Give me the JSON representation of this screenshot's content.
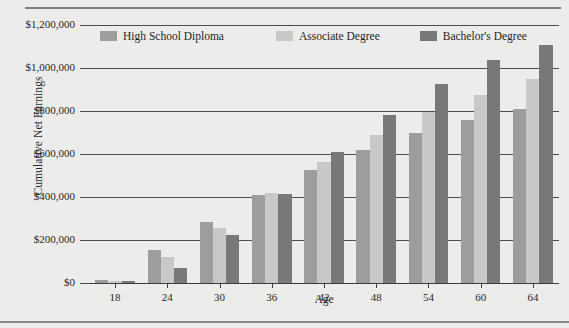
{
  "chart_data": {
    "type": "bar",
    "title": "",
    "xlabel": "Age",
    "ylabel": "Cumulative Net Earnings",
    "categories": [
      "18",
      "24",
      "30",
      "36",
      "42",
      "48",
      "54",
      "60",
      "64"
    ],
    "ylim": [
      0,
      1200000
    ],
    "ytick_values": [
      0,
      200000,
      400000,
      600000,
      800000,
      1000000,
      1200000
    ],
    "ytick_labels": [
      "$0",
      "$200,000",
      "$400,000",
      "$600,000",
      "$800,000",
      "$1,000,000",
      "$1,200,000"
    ],
    "grid": true,
    "legend_position": "top",
    "series": [
      {
        "name": "High School Diploma",
        "color": "#9d9d9c",
        "values": [
          15000,
          155000,
          285000,
          410000,
          525000,
          620000,
          700000,
          760000,
          810000
        ]
      },
      {
        "name": "Associate Degree",
        "color": "#c8c8c6",
        "values": [
          10000,
          120000,
          255000,
          420000,
          565000,
          690000,
          795000,
          875000,
          950000
        ]
      },
      {
        "name": "Bachelor's Degree",
        "color": "#787877",
        "values": [
          8000,
          70000,
          225000,
          415000,
          610000,
          780000,
          925000,
          1035000,
          1105000
        ]
      }
    ]
  }
}
